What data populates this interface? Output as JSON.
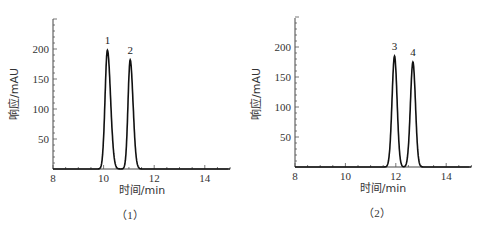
{
  "chart_data": [
    {
      "type": "line",
      "caption": "（1）",
      "xlabel": "时间/min",
      "ylabel": "响应/mAU",
      "xlim": [
        8,
        15
      ],
      "ylim": [
        0,
        250
      ],
      "xticks": [
        8,
        10,
        12,
        14
      ],
      "yticks": [
        50,
        100,
        150,
        200
      ],
      "grid": false,
      "peaks": [
        {
          "label": "1",
          "time": 10.15,
          "height": 198,
          "width": 0.12
        },
        {
          "label": "2",
          "time": 11.05,
          "height": 182,
          "width": 0.11
        }
      ]
    },
    {
      "type": "line",
      "caption": "（2）",
      "xlabel": "时间/min",
      "ylabel": "响应/mAU",
      "xlim": [
        8,
        15
      ],
      "ylim": [
        0,
        250
      ],
      "xticks": [
        8,
        10,
        12,
        14
      ],
      "yticks": [
        50,
        100,
        150,
        200
      ],
      "grid": false,
      "peaks": [
        {
          "label": "3",
          "time": 11.95,
          "height": 185,
          "width": 0.13
        },
        {
          "label": "4",
          "time": 12.68,
          "height": 175,
          "width": 0.13
        }
      ]
    }
  ]
}
